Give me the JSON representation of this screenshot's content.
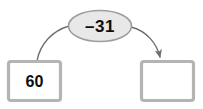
{
  "diagram": {
    "type": "arrow-diagram",
    "background_color": "#ffffff",
    "operator_node": {
      "label": "–31",
      "operation": "subtract",
      "operand": 31,
      "shape": "ellipse",
      "fill_color": "#e8e8e8",
      "border_color": "#9a9a9a",
      "text_color": "#111111"
    },
    "start_box": {
      "label": "60",
      "value": 60,
      "fill_color": "#ffffff",
      "border_color": "#b4b4b4",
      "text_color": "#111111",
      "empty": false
    },
    "end_box": {
      "label": "",
      "value": "",
      "fill_color": "#ffffff",
      "border_color": "#b4b4b4",
      "text_color": "#111111",
      "empty": true
    },
    "connectors": [
      {
        "name": "start-to-operator",
        "from": "start_box",
        "to": "operator_node",
        "has_arrowhead": false,
        "stroke_color": "#707070"
      },
      {
        "name": "operator-to-end",
        "from": "operator_node",
        "to": "end_box",
        "has_arrowhead": true,
        "stroke_color": "#707070"
      }
    ]
  }
}
